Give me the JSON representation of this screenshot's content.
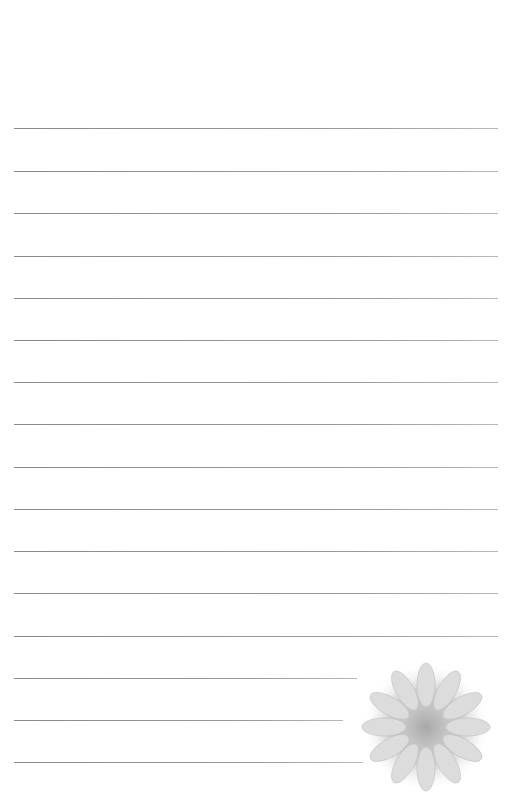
{
  "page": {
    "type": "lined-stationery",
    "background_color": "#ffffff",
    "line_color": "#8f8f8f"
  },
  "lines": [
    {
      "y": 128,
      "x1": 14,
      "x2": 498
    },
    {
      "y": 171,
      "x1": 14,
      "x2": 498
    },
    {
      "y": 213,
      "x1": 14,
      "x2": 498
    },
    {
      "y": 256,
      "x1": 14,
      "x2": 498
    },
    {
      "y": 298,
      "x1": 14,
      "x2": 498
    },
    {
      "y": 340,
      "x1": 14,
      "x2": 498
    },
    {
      "y": 382,
      "x1": 14,
      "x2": 498
    },
    {
      "y": 424,
      "x1": 14,
      "x2": 498
    },
    {
      "y": 467,
      "x1": 14,
      "x2": 498
    },
    {
      "y": 509,
      "x1": 14,
      "x2": 498
    },
    {
      "y": 551,
      "x1": 14,
      "x2": 498
    },
    {
      "y": 593,
      "x1": 14,
      "x2": 498
    },
    {
      "y": 636,
      "x1": 14,
      "x2": 498
    },
    {
      "y": 678,
      "x1": 14,
      "x2": 357
    },
    {
      "y": 720,
      "x1": 14,
      "x2": 343
    },
    {
      "y": 762,
      "x1": 14,
      "x2": 363
    }
  ],
  "decoration": {
    "icon": "flower-icon",
    "description": "faded chrysanthemum photo"
  }
}
